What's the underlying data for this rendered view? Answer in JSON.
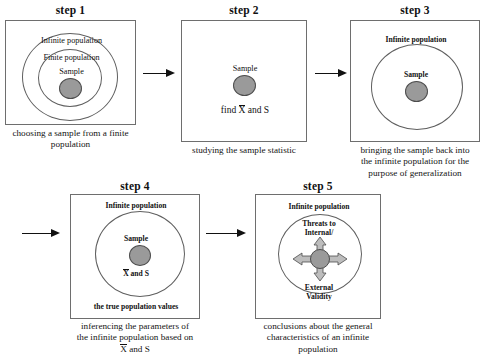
{
  "diagram": {
    "title_text": "Sampling and generalization process",
    "background": "#ffffff",
    "line_color": "#6e6e6e",
    "dot_fill": "#9a9a9a",
    "dot_stroke": "#4d4d4d"
  },
  "steps": [
    {
      "id": "step1",
      "title": "step 1",
      "caption": "choosing a sample from a finite population",
      "caption_lines": [
        "choosing a sample from a finite",
        "population"
      ],
      "labels": {
        "outer": "Infinite population",
        "middle": "Finite population",
        "inner": "Sample"
      }
    },
    {
      "id": "step2",
      "title": "step 2",
      "caption": "studying the sample statistic",
      "caption_lines": [
        "studying the sample statistic"
      ],
      "labels": {
        "inner": "Sample",
        "statistic_prefix": "find ",
        "statistic_xbar": "X",
        "statistic_suffix": " and S"
      }
    },
    {
      "id": "step3",
      "title": "step 3",
      "caption": "bringing the sample back into the infinite population for the purpose of generalization",
      "caption_lines": [
        "bringing the sample back into",
        "the infinite population for the",
        "purpose of generalization"
      ],
      "labels": {
        "outer": "Infinite population",
        "inner": "Sample"
      }
    },
    {
      "id": "step4",
      "title": "step 4",
      "caption": "inferencing the parameters of the infinite population based on X and S",
      "caption_lines": [
        "inferencing the parameters of",
        "the infinite population based on",
        "X and S"
      ],
      "caption_line3_xbar": "X",
      "caption_line3_rest": " and S",
      "labels": {
        "outer": "Infinite population",
        "inner": "Sample",
        "statistic_xbar": "X",
        "statistic_rest": " and S",
        "footer": "the true population values"
      }
    },
    {
      "id": "step5",
      "title": "step 5",
      "caption": "conclusions about the general characteristics of an infinite population",
      "caption_lines": [
        "conclusions about the general",
        "characteristics of an infinite",
        "population"
      ],
      "labels": {
        "outer": "Infinite population",
        "threats_line1": "Threats to",
        "threats_line2": "Internal/",
        "validity_line1": "External",
        "validity_line2": "Validity"
      }
    }
  ],
  "connectors": [
    {
      "id": "arrow-1-2",
      "from": "step1",
      "to": "step2",
      "direction": "right"
    },
    {
      "id": "arrow-2-3",
      "from": "step2",
      "to": "step3",
      "direction": "right"
    },
    {
      "id": "arrow-3-4",
      "from": "step3",
      "to": "step4",
      "direction": "right"
    },
    {
      "id": "arrow-4-5",
      "from": "step4",
      "to": "step5",
      "direction": "right"
    }
  ]
}
